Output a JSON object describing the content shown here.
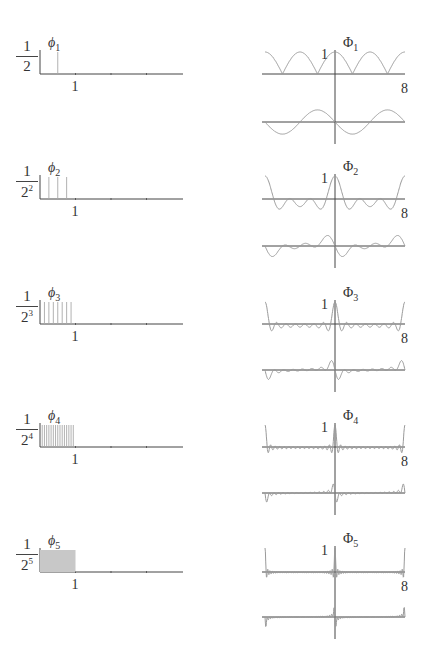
{
  "figure": {
    "rows": [
      {
        "index": 1,
        "phi_label": "ϕ",
        "phi_sub": "1",
        "height_num": "1",
        "height_den": "2",
        "height_exp": "",
        "spikes": 1,
        "x_tick": "1",
        "Phi_label": "Φ",
        "Phi_sub": "1",
        "Phi_peak_label": "1",
        "Phi_x_label": "8"
      },
      {
        "index": 2,
        "phi_label": "ϕ",
        "phi_sub": "2",
        "height_num": "1",
        "height_den": "2",
        "height_exp": "2",
        "spikes": 3,
        "x_tick": "1",
        "Phi_label": "Φ",
        "Phi_sub": "2",
        "Phi_peak_label": "1",
        "Phi_x_label": "8"
      },
      {
        "index": 3,
        "phi_label": "ϕ",
        "phi_sub": "3",
        "height_num": "1",
        "height_den": "2",
        "height_exp": "3",
        "spikes": 7,
        "x_tick": "1",
        "Phi_label": "Φ",
        "Phi_sub": "3",
        "Phi_peak_label": "1",
        "Phi_x_label": "8"
      },
      {
        "index": 4,
        "phi_label": "ϕ",
        "phi_sub": "4",
        "height_num": "1",
        "height_den": "2",
        "height_exp": "4",
        "spikes": 15,
        "x_tick": "1",
        "Phi_label": "Φ",
        "Phi_sub": "4",
        "Phi_peak_label": "1",
        "Phi_x_label": "8"
      },
      {
        "index": 5,
        "phi_label": "ϕ",
        "phi_sub": "5",
        "height_num": "1",
        "height_den": "2",
        "height_exp": "5",
        "spikes": 31,
        "x_tick": "1",
        "Phi_label": "Φ",
        "Phi_sub": "5",
        "Phi_peak_label": "1",
        "Phi_x_label": "8"
      }
    ]
  },
  "colors": {
    "axis": "#444444",
    "curve": "#9a9a9a",
    "spike": "#a8a8a8",
    "fill5": "#c8c8c8"
  },
  "chart_data": [
    {
      "type": "bar",
      "title": "ϕ1",
      "x_range": [
        0,
        4
      ],
      "tick_labels": [
        "1"
      ],
      "spike_height": "1/2",
      "spike_positions": [
        0.5
      ]
    },
    {
      "type": "bar",
      "title": "ϕ2",
      "x_range": [
        0,
        4
      ],
      "tick_labels": [
        "1"
      ],
      "spike_height": "1/2^2",
      "spike_positions": [
        0.25,
        0.5,
        0.75
      ]
    },
    {
      "type": "bar",
      "title": "ϕ3",
      "x_range": [
        0,
        4
      ],
      "tick_labels": [
        "1"
      ],
      "spike_height": "1/2^3",
      "spike_count": 7
    },
    {
      "type": "bar",
      "title": "ϕ4",
      "x_range": [
        0,
        4
      ],
      "tick_labels": [
        "1"
      ],
      "spike_height": "1/2^4",
      "spike_count": 15
    },
    {
      "type": "bar",
      "title": "ϕ5",
      "x_range": [
        0,
        4
      ],
      "tick_labels": [
        "1"
      ],
      "spike_height": "1/2^5",
      "spike_count": 31
    },
    {
      "type": "line",
      "title": "Φ1..Φ5",
      "x_range": [
        -8,
        8
      ],
      "y_peak_label": "1",
      "x_label": "8",
      "series": [
        "real part (top)",
        "imaginary part (bottom)"
      ]
    }
  ]
}
